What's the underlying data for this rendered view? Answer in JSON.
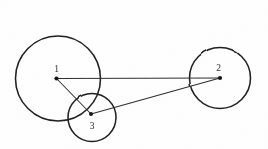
{
  "figure": {
    "background_color": "#fefefe",
    "ink_color": "#1c1c1c",
    "line_color": "#2b2b2b",
    "label_color": "#2a2a2a",
    "width": 268,
    "height": 149
  },
  "chart_data": {
    "type": "diagram",
    "title": "",
    "xlabel": "",
    "ylabel": "",
    "nodes": [
      {
        "id": "1",
        "label": "1",
        "cx": 56.5,
        "cy": 78.5,
        "label_x": 56.5,
        "label_y": 71.5
      },
      {
        "id": "2",
        "label": "2",
        "cx": 220.0,
        "cy": 78.0,
        "label_x": 218.5,
        "label_y": 71.0
      },
      {
        "id": "3",
        "label": "3",
        "cx": 91.0,
        "cy": 114.0,
        "label_x": 92.0,
        "label_y": 129.0
      }
    ],
    "circles": [
      {
        "id": "circle-1",
        "cx": 58.0,
        "cy": 78.5,
        "r": 42.5
      },
      {
        "id": "circle-2",
        "cx": 220.0,
        "cy": 78.0,
        "r": 30.5
      },
      {
        "id": "circle-3",
        "cx": 92.0,
        "cy": 117.5,
        "r": 24.0
      }
    ],
    "edges": [
      {
        "id": "edge-1-2",
        "from": "1",
        "to": "2",
        "x1": 56.5,
        "y1": 78.5,
        "x2": 220.0,
        "y2": 78.0
      },
      {
        "id": "edge-1-3",
        "from": "1",
        "to": "3",
        "x1": 56.5,
        "y1": 78.5,
        "x2": 91.0,
        "y2": 114.0
      },
      {
        "id": "edge-3-2",
        "from": "3",
        "to": "2",
        "x1": 91.0,
        "y1": 114.0,
        "x2": 220.0,
        "y2": 78.0
      }
    ]
  }
}
